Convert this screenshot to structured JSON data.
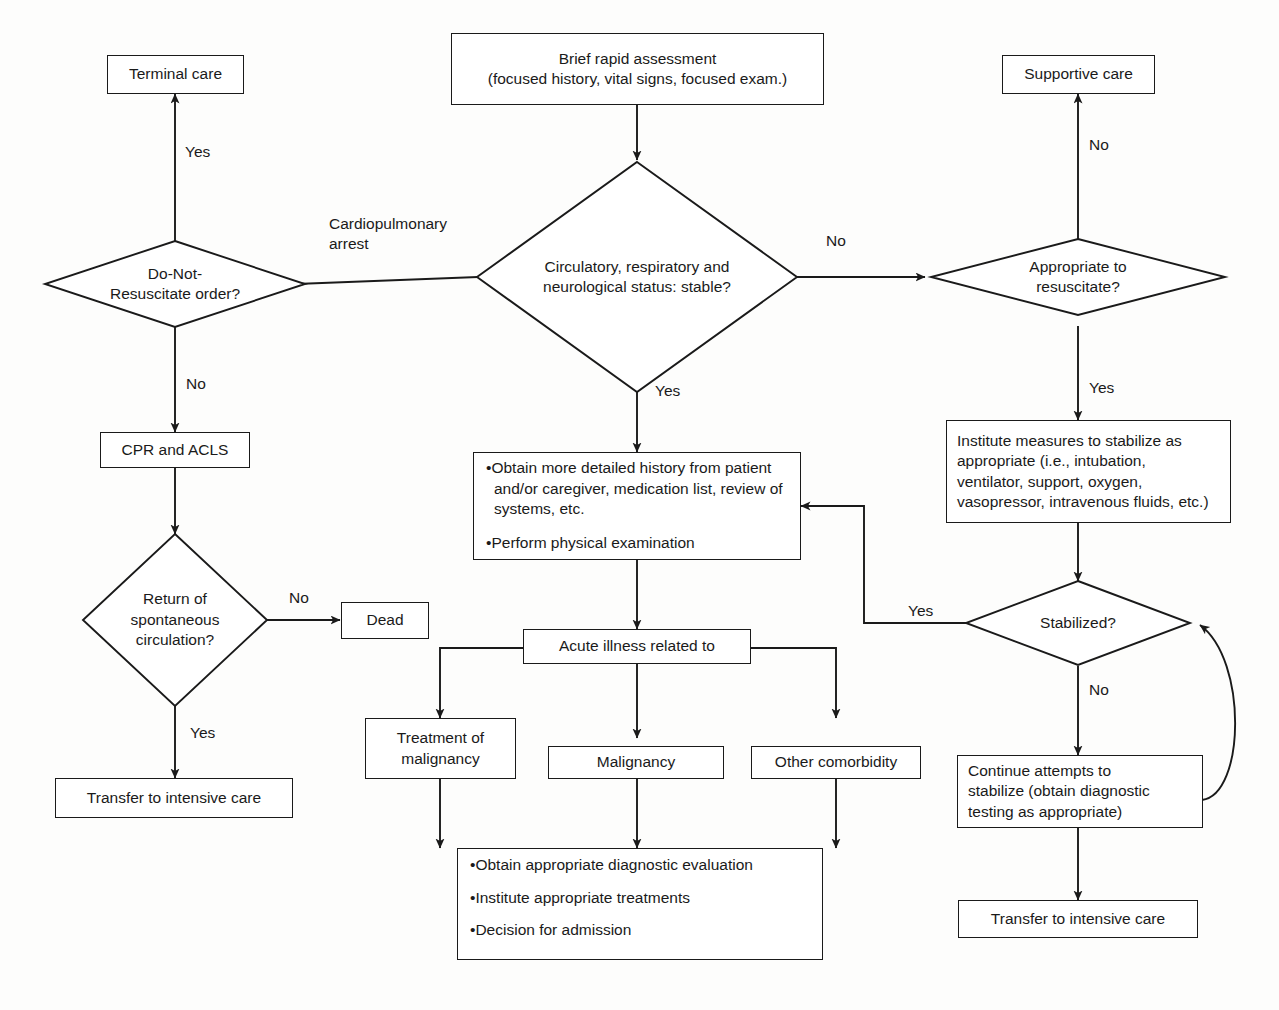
{
  "diagram": {
    "stroke_color": "#1a1a1a",
    "fill_color": "#ffffff",
    "background": "#fdfdfc"
  },
  "nodes": {
    "brief_assessment": {
      "label": "Brief rapid assessment\n(focused history, vital signs, focused exam.)",
      "line1": "Brief rapid assessment",
      "line2": "(focused history, vital signs, focused exam.)",
      "shape": "box"
    },
    "terminal_care": {
      "label": "Terminal care",
      "shape": "box"
    },
    "supportive_care": {
      "label": "Supportive care",
      "shape": "box"
    },
    "dnr_order": {
      "label": "Do-Not-\nResuscitate order?",
      "line1": "Do-Not-",
      "line2": "Resuscitate order?",
      "shape": "diamond"
    },
    "status_stable": {
      "label": "Circulatory, respiratory and\nneurological status: stable?",
      "line1": "Circulatory, respiratory and",
      "line2": "neurological status: stable?",
      "shape": "diamond"
    },
    "appropriate_resuscitate": {
      "label": "Appropriate to\nresuscitate?",
      "line1": "Appropriate to",
      "line2": "resuscitate?",
      "shape": "diamond"
    },
    "cpr_acls": {
      "label": "CPR and ACLS",
      "shape": "box"
    },
    "return_circulation": {
      "label": "Return of\nspontaneous\ncirculation?",
      "line1": "Return of",
      "line2": "spontaneous",
      "line3": "circulation?",
      "shape": "diamond"
    },
    "dead": {
      "label": "Dead",
      "shape": "box"
    },
    "transfer_icu_left": {
      "label": "Transfer to intensive care",
      "shape": "box"
    },
    "detailed_history": {
      "shape": "box",
      "bullets": [
        "Obtain more detailed history from patient and/or caregiver, medication list, review of systems, etc.",
        "Perform physical examination"
      ]
    },
    "institute_measures": {
      "shape": "box",
      "line1": "Institute measures to stabilize as",
      "line2": "appropriate (i.e., intubation,",
      "line3": "ventilator, support, oxygen,",
      "line4": "vasopressor, intravenous fluids, etc.)"
    },
    "acute_illness": {
      "label": "Acute illness related to",
      "shape": "box"
    },
    "treatment_malignancy": {
      "label": "Treatment of\nmalignancy",
      "line1": "Treatment of",
      "line2": "malignancy",
      "shape": "box"
    },
    "malignancy": {
      "label": "Malignancy",
      "shape": "box"
    },
    "other_comorbidity": {
      "label": "Other comorbidity",
      "shape": "box"
    },
    "diagnostic_plan": {
      "shape": "box",
      "bullets": [
        "Obtain appropriate diagnostic evaluation",
        "Institute appropriate treatments",
        "Decision for admission"
      ]
    },
    "stabilized": {
      "label": "Stabilized?",
      "shape": "diamond"
    },
    "continue_stabilize": {
      "shape": "box",
      "line1": "Continue attempts to",
      "line2": "stabilize (obtain diagnostic",
      "line3": "testing as appropriate)"
    },
    "transfer_icu_right": {
      "label": "Transfer to intensive care",
      "shape": "box"
    }
  },
  "edge_labels": {
    "dnr_yes": "Yes",
    "dnr_no": "No",
    "cardiopulmonary_arrest": "Cardiopulmonary\narrest",
    "status_no": "No",
    "status_yes": "Yes",
    "resuscitate_no": "No",
    "resuscitate_yes": "Yes",
    "rosc_no": "No",
    "rosc_yes": "Yes",
    "stabilized_yes": "Yes",
    "stabilized_no": "No"
  }
}
